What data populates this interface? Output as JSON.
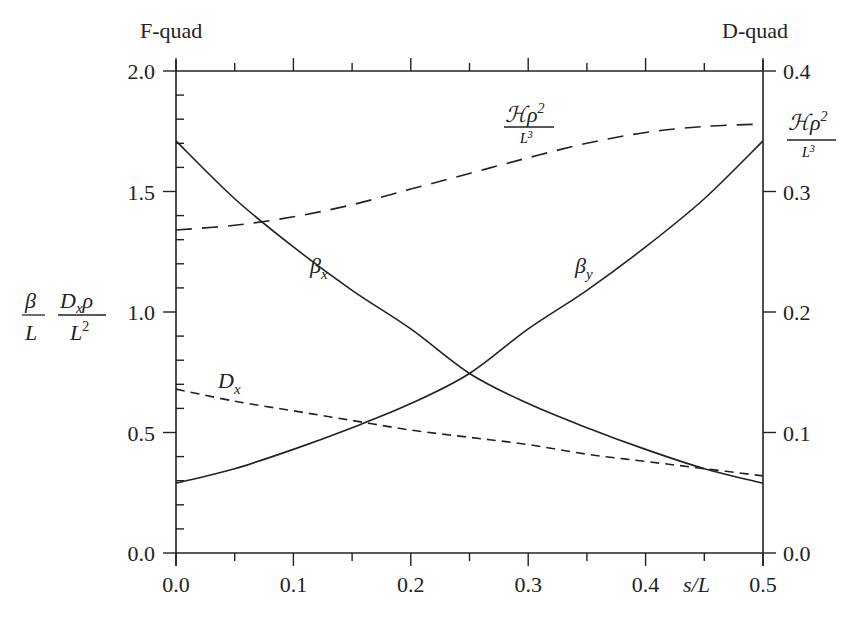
{
  "chart_data": {
    "type": "line",
    "title": "",
    "corner_labels": {
      "left": "F-quad",
      "right": "D-quad"
    },
    "xlabel": "s/L",
    "ylabel_left": "β/L   Dxρ/L²",
    "ylabel_right": "Hρ²/L³",
    "xlim": [
      0.0,
      0.5
    ],
    "ylim_left": [
      0.0,
      2.0
    ],
    "ylim_right": [
      0.0,
      0.4
    ],
    "x_ticks": [
      "0.0",
      "0.1",
      "0.2",
      "0.3",
      "0.4",
      "0.5"
    ],
    "y_ticks_left": [
      "0.0",
      "0.5",
      "1.0",
      "1.5",
      "2.0"
    ],
    "y_ticks_right": [
      "0.0",
      "0.1",
      "0.2",
      "0.3",
      "0.4"
    ],
    "grid": false,
    "x": [
      0.0,
      0.05,
      0.1,
      0.15,
      0.2,
      0.25,
      0.3,
      0.35,
      0.4,
      0.45,
      0.5
    ],
    "series": [
      {
        "name": "βx",
        "axis": "left",
        "style": "solid",
        "values": [
          1.71,
          1.47,
          1.27,
          1.09,
          0.93,
          0.745,
          0.62,
          0.52,
          0.43,
          0.35,
          0.29
        ]
      },
      {
        "name": "βy",
        "axis": "left",
        "style": "solid",
        "values": [
          0.29,
          0.35,
          0.43,
          0.52,
          0.62,
          0.745,
          0.93,
          1.09,
          1.27,
          1.47,
          1.71
        ]
      },
      {
        "name": "Dx",
        "axis": "left",
        "style": "dashed",
        "values": [
          0.68,
          0.63,
          0.59,
          0.55,
          0.51,
          0.48,
          0.45,
          0.41,
          0.38,
          0.35,
          0.32
        ]
      },
      {
        "name": "Hρ²/L³",
        "axis": "right",
        "style": "long-dashed",
        "values": [
          0.268,
          0.272,
          0.279,
          0.289,
          0.302,
          0.315,
          0.328,
          0.34,
          0.349,
          0.354,
          0.356
        ]
      }
    ],
    "annotations": [
      {
        "text": "βx",
        "x": 0.125,
        "y": 1.0
      },
      {
        "text": "βy",
        "x": 0.34,
        "y": 1.0
      },
      {
        "text": "Dx",
        "x": 0.05,
        "y": 0.62
      },
      {
        "text": "Hρ²/L³",
        "x": 0.33,
        "y_right": 0.37
      }
    ]
  }
}
